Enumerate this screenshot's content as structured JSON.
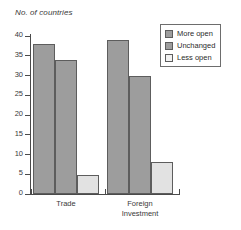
{
  "chart_data": {
    "type": "bar",
    "title": "",
    "subtitle": "",
    "xlabel": "",
    "ylabel": "No. of countries",
    "ylim": [
      0,
      40
    ],
    "yticks": [
      0,
      5,
      10,
      15,
      20,
      25,
      30,
      35,
      40
    ],
    "ytick_labels": [
      "0",
      "5",
      "10",
      "15",
      "20",
      "25",
      "30",
      "35",
      "40"
    ],
    "grid": false,
    "legend_position": "top-right",
    "categories": [
      "Trade",
      "Foreign Investment"
    ],
    "category_labels": [
      "Trade",
      "Foreign\nInvestment"
    ],
    "series": [
      {
        "name": "More open",
        "values": [
          38,
          39
        ],
        "color": "#9d9d9d"
      },
      {
        "name": "Unchanged",
        "values": [
          34,
          30
        ],
        "color": "#9d9d9d"
      },
      {
        "name": "Less open",
        "values": [
          4.7,
          8
        ],
        "color": "#e2e2e2"
      }
    ],
    "annotations": []
  },
  "legend": {
    "items": [
      {
        "label": "More open"
      },
      {
        "label": "Unchanged"
      },
      {
        "label": "Less open"
      }
    ]
  }
}
